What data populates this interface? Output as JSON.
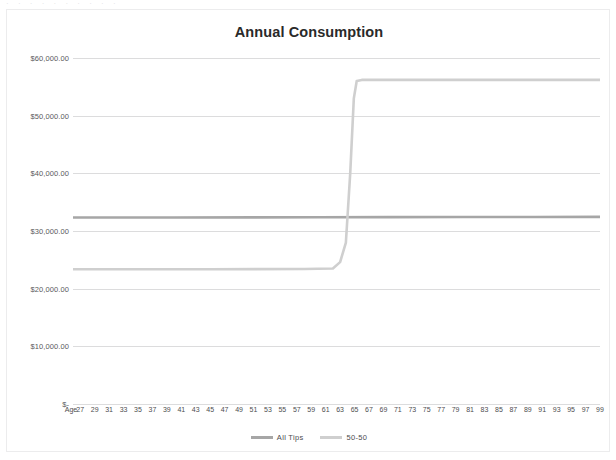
{
  "clipped_top_text": "· · · · · · · · · ·",
  "chart_data": {
    "type": "line",
    "title": "Annual Consumption",
    "xlabel": "",
    "ylabel": "",
    "grid": true,
    "legend_position": "bottom",
    "ylim": [
      0,
      60000
    ],
    "y_ticks": [
      0,
      10000,
      20000,
      30000,
      40000,
      50000,
      60000
    ],
    "y_tick_labels": [
      "$-",
      "$10,000.00",
      "$20,000.00",
      "$30,000.00",
      "$40,000.00",
      "$50,000.00",
      "$60,000.00"
    ],
    "x_axis_leading_label": "Age",
    "x_tick_labels": [
      "27",
      "29",
      "31",
      "33",
      "35",
      "37",
      "39",
      "41",
      "43",
      "45",
      "47",
      "49",
      "51",
      "53",
      "55",
      "57",
      "59",
      "61",
      "63",
      "65",
      "67",
      "69",
      "71",
      "73",
      "75",
      "77",
      "79",
      "81",
      "83",
      "85",
      "87",
      "89",
      "91",
      "93",
      "95",
      "97",
      "99"
    ],
    "x_min": 26,
    "x_max": 99,
    "series": [
      {
        "name": "All Tips",
        "color": "#a6a6a6",
        "width": 2.6,
        "points": [
          {
            "x": 26,
            "y": 32350
          },
          {
            "x": 40,
            "y": 32350
          },
          {
            "x": 60,
            "y": 32380
          },
          {
            "x": 70,
            "y": 32400
          },
          {
            "x": 80,
            "y": 32420
          },
          {
            "x": 90,
            "y": 32440
          },
          {
            "x": 99,
            "y": 32450
          }
        ]
      },
      {
        "name": "50-50",
        "color": "#cfcfcf",
        "width": 2.6,
        "points": [
          {
            "x": 26,
            "y": 23380
          },
          {
            "x": 45,
            "y": 23380
          },
          {
            "x": 58,
            "y": 23400
          },
          {
            "x": 62,
            "y": 23500
          },
          {
            "x": 63,
            "y": 24600
          },
          {
            "x": 63.8,
            "y": 28000
          },
          {
            "x": 64.4,
            "y": 40000
          },
          {
            "x": 64.9,
            "y": 53000
          },
          {
            "x": 65.3,
            "y": 56000
          },
          {
            "x": 66,
            "y": 56200
          },
          {
            "x": 75,
            "y": 56200
          },
          {
            "x": 99,
            "y": 56200
          }
        ]
      }
    ]
  },
  "legend": {
    "entries": [
      {
        "label": "All Tips",
        "color": "#a6a6a6"
      },
      {
        "label": "50-50",
        "color": "#cfcfcf"
      }
    ]
  },
  "colors": {
    "background": "#ffffff",
    "frame_border": "#ececed",
    "gridline": "#dcdcdd",
    "title_text": "#2a2a2a",
    "tick_text": "#59595b"
  }
}
